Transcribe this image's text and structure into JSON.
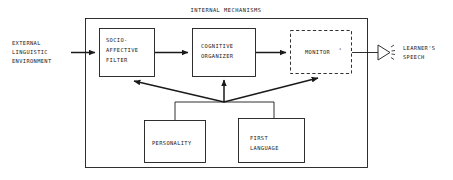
{
  "figure": {
    "title": "INTERNAL MECHANISMS",
    "type": "flow-diagram",
    "background_color": "#ffffff",
    "line_color": "#1a1a1a"
  },
  "input": {
    "label_line1": "EXTERNAL",
    "label_line2": "LINGUISTIC",
    "label_line3": "ENVIRONMENT"
  },
  "output": {
    "label_line1": "LEARNER'S",
    "label_line2": "SPEECH",
    "icon": "speaker-icon"
  },
  "nodes": [
    {
      "id": "filter",
      "label_line1": "SOCIO-",
      "label_line2": "AFFECTIVE",
      "label_line3": "FILTER",
      "border": "solid"
    },
    {
      "id": "organizer",
      "label_line1": "COGNITIVE",
      "label_line2": "ORGANIZER",
      "label_line3": "",
      "border": "solid"
    },
    {
      "id": "monitor",
      "label_line1": "MONITOR",
      "superscript": "*",
      "border": "dashed"
    },
    {
      "id": "personality",
      "label_line1": "PERSONALITY",
      "label_line2": "",
      "border": "solid"
    },
    {
      "id": "first-language",
      "label_line1": "FIRST",
      "label_line2": "LANGUAGE",
      "border": "solid"
    }
  ],
  "connections": [
    {
      "from": "external-linguistic-environment",
      "to": "filter",
      "style": "arrow"
    },
    {
      "from": "filter",
      "to": "organizer",
      "style": "arrow"
    },
    {
      "from": "organizer",
      "to": "monitor",
      "style": "arrow"
    },
    {
      "from": "monitor",
      "to": "learners-speech",
      "style": "line"
    },
    {
      "from": "junction",
      "to": "filter",
      "style": "arrow"
    },
    {
      "from": "junction",
      "to": "organizer",
      "style": "arrow"
    },
    {
      "from": "junction",
      "to": "monitor",
      "style": "arrow"
    },
    {
      "from": "personality",
      "to": "junction",
      "style": "line"
    },
    {
      "from": "first-language",
      "to": "junction",
      "style": "line"
    }
  ]
}
